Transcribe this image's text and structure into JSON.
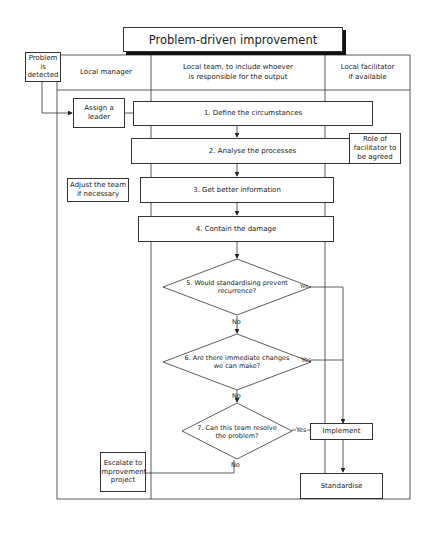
{
  "title": "Problem-driven improvement",
  "lanes": {
    "trigger": "Problem is detected",
    "manager": "Local manager",
    "team_line1": "Local team, to include whoever",
    "team_line2": "is responsible for the output",
    "facilitator_line1": "Local facilitator",
    "facilitator_line2": "if available"
  },
  "steps": {
    "assign_leader": "Assign a leader",
    "step1": "1. Define the circumstances",
    "step2": "2. Analyse the processes",
    "facilitator_role": "Role of facilitator to be agreed",
    "adjust_team": "Adjust the team if necessary",
    "step3": "3. Get better information",
    "step4": "4. Contain the damage",
    "decision5": "5. Would standardising prevent recurrence?",
    "decision6": "6. Are there immediate changes we can make?",
    "decision7": "7. Can this team resolve the problem?",
    "implement": "Implement",
    "standardise": "Standardise",
    "escalate": "Escalate to improvement project"
  },
  "edge_labels": {
    "d5_yes": "Yes",
    "d5_no": "No",
    "d6_yes": "Yes",
    "d6_no": "No",
    "d7_yes": "Yes",
    "d7_no": "No"
  },
  "colors": {
    "line": "#333333",
    "background": "#ffffff",
    "shadow": "#111111"
  }
}
